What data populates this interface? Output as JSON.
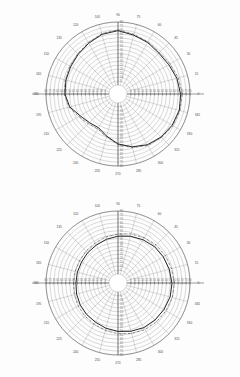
{
  "figure": {
    "kind": "polar-radiation-pattern-pair",
    "background": "#fdfdfd",
    "ink": "#1c1c1c",
    "grid_color": "#8d8d8d"
  },
  "chart_data": [
    {
      "type": "line",
      "title": "",
      "subtitle": "",
      "xlabel": "",
      "ylabel": "",
      "projection": "polar",
      "grid": true,
      "legend": "none",
      "angle_unit": "degrees",
      "angle_direction": "counterclockwise",
      "angle_zero_at": "east",
      "angle_ticks": [
        0,
        15,
        30,
        45,
        60,
        75,
        90,
        105,
        120,
        135,
        150,
        165,
        180,
        195,
        210,
        225,
        240,
        255,
        270,
        285,
        300,
        315,
        330,
        345
      ],
      "angle_tick_labels": [
        "0",
        "15",
        "30",
        "45",
        "60",
        "75",
        "90",
        "105",
        "120",
        "135",
        "150",
        "165",
        "180",
        "195",
        "210",
        "225",
        "240",
        "255",
        "270",
        "285",
        "300",
        "315",
        "330",
        "345"
      ],
      "radial_ticks": [
        0,
        5,
        10,
        15,
        20,
        25,
        30,
        35,
        40,
        45,
        50,
        55,
        60,
        65,
        70,
        75,
        80
      ],
      "radial_tick_labels": [
        "0",
        "5",
        "10",
        "15",
        "20",
        "25",
        "30",
        "35",
        "40",
        "45",
        "50",
        "55",
        "60",
        "65",
        "70",
        "75",
        "80"
      ],
      "rlim": [
        0,
        80
      ],
      "series": [
        {
          "name": "measured",
          "style": "solid",
          "theta": [
            0,
            15,
            30,
            45,
            60,
            75,
            90,
            105,
            120,
            135,
            150,
            165,
            180,
            195,
            210,
            225,
            240,
            255,
            270,
            285,
            300,
            315,
            330,
            345
          ],
          "values": [
            68,
            66,
            63,
            62,
            64,
            66,
            69,
            67,
            63,
            60,
            58,
            57,
            56,
            52,
            44,
            40,
            38,
            44,
            52,
            58,
            63,
            66,
            68,
            69
          ]
        },
        {
          "name": "calculated",
          "style": "dash-dot",
          "theta": [
            0,
            15,
            30,
            45,
            60,
            75,
            90,
            105,
            120,
            135,
            150,
            165,
            180,
            195,
            210,
            225,
            240,
            255,
            270,
            285,
            300,
            315,
            330,
            345
          ],
          "values": [
            70,
            68,
            65,
            63,
            65,
            67,
            70,
            68,
            64,
            61,
            59,
            58,
            57,
            53,
            46,
            42,
            40,
            45,
            53,
            59,
            64,
            67,
            69,
            70
          ]
        }
      ]
    },
    {
      "type": "line",
      "title": "",
      "subtitle": "",
      "xlabel": "",
      "ylabel": "",
      "projection": "polar",
      "grid": true,
      "legend": "none",
      "angle_unit": "degrees",
      "angle_direction": "counterclockwise",
      "angle_zero_at": "east",
      "angle_ticks": [
        0,
        15,
        30,
        45,
        60,
        75,
        90,
        105,
        120,
        135,
        150,
        165,
        180,
        195,
        210,
        225,
        240,
        255,
        270,
        285,
        300,
        315,
        330,
        345
      ],
      "angle_tick_labels": [
        "0",
        "15",
        "30",
        "45",
        "60",
        "75",
        "90",
        "105",
        "120",
        "135",
        "150",
        "165",
        "180",
        "195",
        "210",
        "225",
        "240",
        "255",
        "270",
        "285",
        "300",
        "315",
        "330",
        "345"
      ],
      "radial_ticks": [
        0,
        5,
        10,
        15,
        20,
        25,
        30,
        35,
        40,
        45,
        50,
        55,
        60,
        65,
        70,
        75,
        80
      ],
      "radial_tick_labels": [
        "0",
        "5",
        "10",
        "15",
        "20",
        "25",
        "30",
        "35",
        "40",
        "45",
        "50",
        "55",
        "60",
        "65",
        "70",
        "75",
        "80"
      ],
      "rlim": [
        0,
        80
      ],
      "series": [
        {
          "name": "measured",
          "style": "solid",
          "theta": [
            0,
            15,
            30,
            45,
            60,
            75,
            90,
            105,
            120,
            135,
            150,
            165,
            180,
            195,
            210,
            225,
            240,
            255,
            270,
            285,
            300,
            315,
            330,
            345
          ],
          "values": [
            57,
            56,
            55,
            54,
            52,
            50,
            48,
            46,
            44,
            43,
            42,
            42,
            42,
            43,
            44,
            45,
            46,
            48,
            50,
            52,
            54,
            55,
            56,
            57
          ]
        },
        {
          "name": "calculated",
          "style": "dash-dot",
          "theta": [
            0,
            15,
            30,
            45,
            60,
            75,
            90,
            105,
            120,
            135,
            150,
            165,
            180,
            195,
            210,
            225,
            240,
            255,
            270,
            285,
            300,
            315,
            330,
            345
          ],
          "values": [
            60,
            59,
            58,
            57,
            55,
            53,
            51,
            49,
            47,
            46,
            45,
            45,
            45,
            46,
            47,
            48,
            49,
            51,
            53,
            55,
            57,
            58,
            59,
            60
          ]
        }
      ]
    }
  ]
}
